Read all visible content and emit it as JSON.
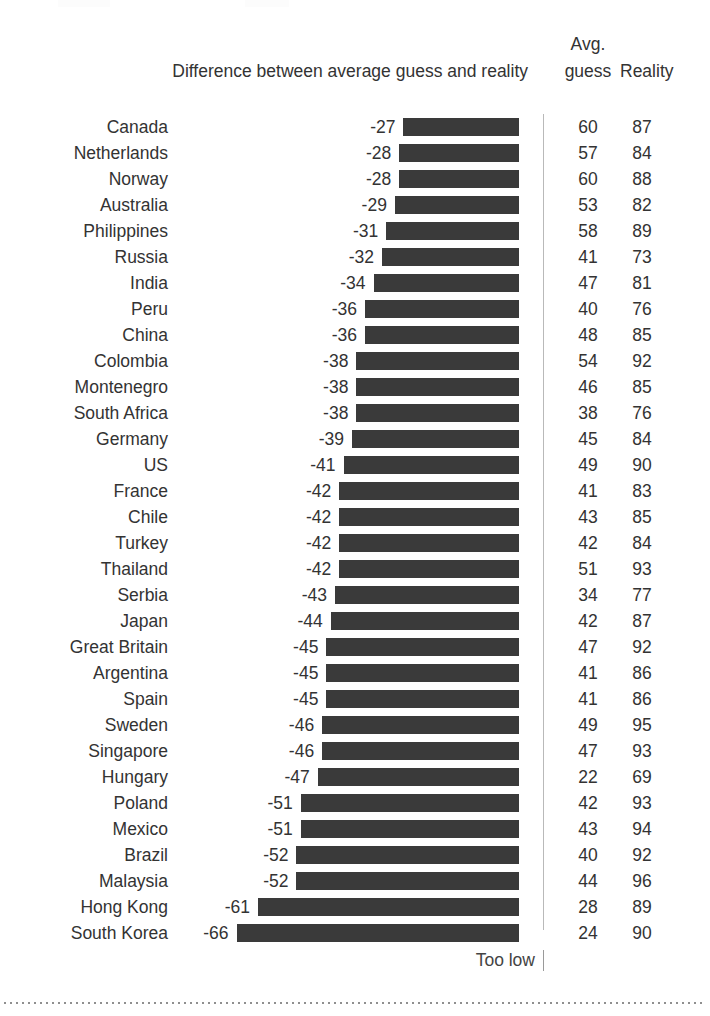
{
  "header": {
    "difference_label": "Difference between average guess and reality",
    "avg_label": "Avg.",
    "guess_label": "guess",
    "reality_label": "Reality"
  },
  "footer": {
    "too_low_label": "Too low"
  },
  "colors": {
    "bar": "#3a3a3a",
    "text": "#333333",
    "axis_line": "#b9b9b9",
    "dotted_rule": "#8f8f8f",
    "background": "#ffffff"
  },
  "chart_data": {
    "type": "bar",
    "title": "",
    "subtitle": "",
    "xlabel": "Difference between average guess and reality",
    "ylabel": "",
    "orientation": "horizontal",
    "grid": false,
    "legend": "none",
    "annotations": [
      "Too low"
    ],
    "axis_note": "Bars extend leftward from a zero axis at the right; all values are negative (guesses too low).",
    "xlim": [
      -70,
      0
    ],
    "categories": [
      "Canada",
      "Netherlands",
      "Norway",
      "Australia",
      "Philippines",
      "Russia",
      "India",
      "Peru",
      "China",
      "Colombia",
      "Montenegro",
      "South Africa",
      "Germany",
      "US",
      "France",
      "Chile",
      "Turkey",
      "Thailand",
      "Serbia",
      "Japan",
      "Great Britain",
      "Argentina",
      "Spain",
      "Sweden",
      "Singapore",
      "Hungary",
      "Poland",
      "Mexico",
      "Brazil",
      "Malaysia",
      "Hong Kong",
      "South Korea"
    ],
    "series": [
      {
        "name": "Difference between average guess and reality",
        "values": [
          -27,
          -28,
          -28,
          -29,
          -31,
          -32,
          -34,
          -36,
          -36,
          -38,
          -38,
          -38,
          -39,
          -41,
          -42,
          -42,
          -42,
          -42,
          -43,
          -44,
          -45,
          -45,
          -45,
          -46,
          -46,
          -47,
          -51,
          -51,
          -52,
          -52,
          -61,
          -66
        ]
      },
      {
        "name": "Avg. guess",
        "values": [
          60,
          57,
          60,
          53,
          58,
          41,
          47,
          40,
          48,
          54,
          46,
          38,
          45,
          49,
          41,
          43,
          42,
          51,
          34,
          42,
          47,
          41,
          41,
          49,
          47,
          22,
          42,
          43,
          40,
          44,
          28,
          24
        ]
      },
      {
        "name": "Reality",
        "values": [
          87,
          84,
          88,
          82,
          89,
          73,
          81,
          76,
          85,
          92,
          85,
          76,
          84,
          90,
          83,
          85,
          84,
          93,
          77,
          87,
          92,
          86,
          86,
          95,
          93,
          69,
          93,
          94,
          92,
          96,
          89,
          90
        ]
      }
    ],
    "rows": [
      {
        "country": "Canada",
        "difference": -27,
        "avg_guess": 60,
        "reality": 87
      },
      {
        "country": "Netherlands",
        "difference": -28,
        "avg_guess": 57,
        "reality": 84
      },
      {
        "country": "Norway",
        "difference": -28,
        "avg_guess": 60,
        "reality": 88
      },
      {
        "country": "Australia",
        "difference": -29,
        "avg_guess": 53,
        "reality": 82
      },
      {
        "country": "Philippines",
        "difference": -31,
        "avg_guess": 58,
        "reality": 89
      },
      {
        "country": "Russia",
        "difference": -32,
        "avg_guess": 41,
        "reality": 73
      },
      {
        "country": "India",
        "difference": -34,
        "avg_guess": 47,
        "reality": 81
      },
      {
        "country": "Peru",
        "difference": -36,
        "avg_guess": 40,
        "reality": 76
      },
      {
        "country": "China",
        "difference": -36,
        "avg_guess": 48,
        "reality": 85
      },
      {
        "country": "Colombia",
        "difference": -38,
        "avg_guess": 54,
        "reality": 92
      },
      {
        "country": "Montenegro",
        "difference": -38,
        "avg_guess": 46,
        "reality": 85
      },
      {
        "country": "South Africa",
        "difference": -38,
        "avg_guess": 38,
        "reality": 76
      },
      {
        "country": "Germany",
        "difference": -39,
        "avg_guess": 45,
        "reality": 84
      },
      {
        "country": "US",
        "difference": -41,
        "avg_guess": 49,
        "reality": 90
      },
      {
        "country": "France",
        "difference": -42,
        "avg_guess": 41,
        "reality": 83
      },
      {
        "country": "Chile",
        "difference": -42,
        "avg_guess": 43,
        "reality": 85
      },
      {
        "country": "Turkey",
        "difference": -42,
        "avg_guess": 42,
        "reality": 84
      },
      {
        "country": "Thailand",
        "difference": -42,
        "avg_guess": 51,
        "reality": 93
      },
      {
        "country": "Serbia",
        "difference": -43,
        "avg_guess": 34,
        "reality": 77
      },
      {
        "country": "Japan",
        "difference": -44,
        "avg_guess": 42,
        "reality": 87
      },
      {
        "country": "Great Britain",
        "difference": -45,
        "avg_guess": 47,
        "reality": 92
      },
      {
        "country": "Argentina",
        "difference": -45,
        "avg_guess": 41,
        "reality": 86
      },
      {
        "country": "Spain",
        "difference": -45,
        "avg_guess": 41,
        "reality": 86
      },
      {
        "country": "Sweden",
        "difference": -46,
        "avg_guess": 49,
        "reality": 95
      },
      {
        "country": "Singapore",
        "difference": -46,
        "avg_guess": 47,
        "reality": 93
      },
      {
        "country": "Hungary",
        "difference": -47,
        "avg_guess": 22,
        "reality": 69
      },
      {
        "country": "Poland",
        "difference": -51,
        "avg_guess": 42,
        "reality": 93
      },
      {
        "country": "Mexico",
        "difference": -51,
        "avg_guess": 43,
        "reality": 94
      },
      {
        "country": "Brazil",
        "difference": -52,
        "avg_guess": 40,
        "reality": 92
      },
      {
        "country": "Malaysia",
        "difference": -52,
        "avg_guess": 44,
        "reality": 96
      },
      {
        "country": "Hong Kong",
        "difference": -61,
        "avg_guess": 28,
        "reality": 89
      },
      {
        "country": "South Korea",
        "difference": -66,
        "avg_guess": 24,
        "reality": 90
      }
    ]
  }
}
